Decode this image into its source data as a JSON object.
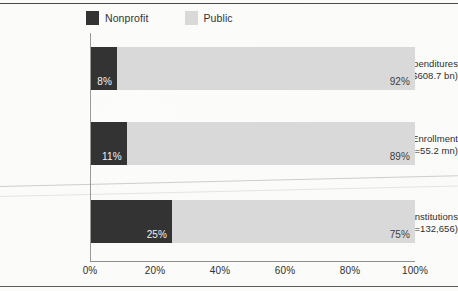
{
  "chart_data": {
    "type": "bar",
    "orientation": "horizontal",
    "stacked": true,
    "stacked_normalized": true,
    "title": "",
    "subtitle": "",
    "xlabel": "",
    "ylabel": "",
    "xlim": [
      0,
      100
    ],
    "grid": false,
    "legend_position": "top-left",
    "categories": [
      "Expenditures (n=$608.7 bn)",
      "Enrollment (n=55.2 mn)",
      "Institutions (n=132,656)"
    ],
    "category_lines": [
      {
        "line1": "Expenditures",
        "line2": "(n=$608.7 bn)"
      },
      {
        "line1": "Enrollment",
        "line2": "(n=55.2 mn)"
      },
      {
        "line1": "Institutions",
        "line2": "(n=132,656)"
      }
    ],
    "series": [
      {
        "name": "Nonprofit",
        "color": "#333333",
        "values": [
          8,
          11,
          25
        ],
        "labels": [
          "8%",
          "11%",
          "25%"
        ]
      },
      {
        "name": "Public",
        "color": "#d9d9d9",
        "values": [
          92,
          89,
          75
        ],
        "labels": [
          "92%",
          "89%",
          "75%"
        ]
      }
    ],
    "xticks": [
      0,
      20,
      40,
      60,
      80,
      100
    ],
    "xtick_labels": [
      "0%",
      "20%",
      "40%",
      "60%",
      "80%",
      "100%"
    ]
  },
  "legend": {
    "items": [
      {
        "label": "Nonprofit",
        "color": "#333333"
      },
      {
        "label": "Public",
        "color": "#d9d9d9"
      }
    ]
  },
  "colors": {
    "nonprofit": "#333333",
    "public": "#d9d9d9",
    "axis": "#8e8e8e",
    "frame": "#4a4a4a",
    "text": "#2f2f2f"
  }
}
